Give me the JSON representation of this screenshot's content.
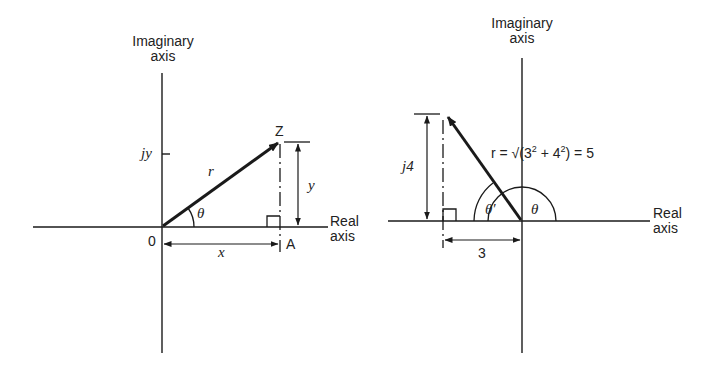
{
  "diagrams": [
    {
      "id": "general",
      "imag_axis_label_line1": "Imaginary",
      "imag_axis_label_line2": "axis",
      "real_axis_label_line1": "Real",
      "real_axis_label_line2": "axis",
      "origin_label": "0",
      "point_label": "Z",
      "foot_label": "A",
      "imag_tick_label": "jy",
      "radius_label": "r",
      "angle_label": "θ",
      "vertical_dim_label": "y",
      "horizontal_dim_label": "x"
    },
    {
      "id": "example",
      "imag_axis_label_line1": "Imaginary",
      "imag_axis_label_line2": "axis",
      "real_axis_label_line1": "Real",
      "real_axis_label_line2": "axis",
      "vertical_dim_label": "j4",
      "horizontal_dim_label": "3",
      "radius_formula": {
        "prefix": "r = √(3",
        "sup1": "2",
        "mid": " + 4",
        "sup2": "2",
        "suffix": ") = 5"
      },
      "angle_label": "θ",
      "ref_angle_label": "θ′"
    }
  ],
  "colors": {
    "ink": "#1a1a1a",
    "background": "#ffffff"
  }
}
